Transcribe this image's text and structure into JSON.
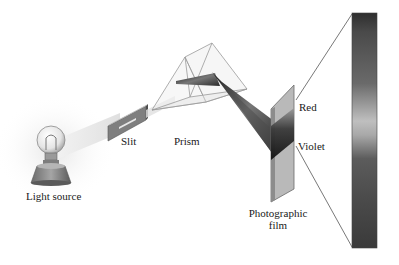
{
  "diagram": {
    "components": [
      {
        "id": "light-source",
        "label": "Light source"
      },
      {
        "id": "slit",
        "label": "Slit"
      },
      {
        "id": "prism",
        "label": "Prism"
      },
      {
        "id": "film",
        "label": "Photographic film",
        "label_lines": [
          "Photographic",
          "film"
        ]
      },
      {
        "id": "spectrum",
        "label": ""
      }
    ],
    "spectrum_labels": {
      "red": "Red",
      "violet": "Violet"
    },
    "colors": {
      "beam_dark": "#2a2a2a",
      "film_gray": "#b5b5b5",
      "spectrum_dark": "#3a3a3a",
      "spectrum_light": "#bdbdbd",
      "line": "#555555"
    }
  }
}
